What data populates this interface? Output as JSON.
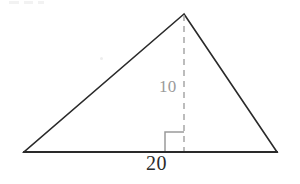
{
  "figure": {
    "kind": "geometry-diagram",
    "shape": "triangle",
    "background_color": "#ffffff",
    "canvas": {
      "width": 300,
      "height": 184
    },
    "outline": {
      "stroke_color": "#2a2a2a",
      "stroke_width": 1.6,
      "vertices": [
        {
          "name": "apex",
          "x": 184,
          "y": 14
        },
        {
          "name": "bottom-left",
          "x": 24,
          "y": 152
        },
        {
          "name": "bottom-right",
          "x": 277,
          "y": 152
        }
      ]
    },
    "altitude": {
      "label": "10",
      "label_color": "#9a9a9a",
      "stroke_color": "#a6a6a6",
      "stroke_width": 1.5,
      "dash": "6 5",
      "from": {
        "x": 184,
        "y": 14
      },
      "to": {
        "x": 184,
        "y": 152
      }
    },
    "base": {
      "label": "20",
      "label_color": "#2b2b2b",
      "from": {
        "x": 24,
        "y": 152
      },
      "to": {
        "x": 277,
        "y": 152
      }
    },
    "right_angle_marker": {
      "stroke_color": "#9a9a9a",
      "stroke_width": 1.5,
      "size": 19,
      "corner": {
        "x": 184,
        "y": 151
      },
      "opens": "left"
    },
    "artifacts": {
      "top_left_smudge": "faint scanned text remnant",
      "interior_speck": "faint dust speck"
    }
  }
}
